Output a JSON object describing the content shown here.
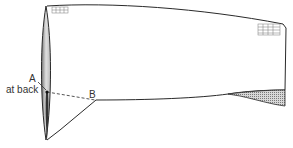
{
  "diagram": {
    "labels": {
      "point_a": "A",
      "point_a_note": "at back",
      "point_b": "B"
    },
    "colors": {
      "line": "#2a2a2a",
      "shade": "#9a9a9a",
      "background": "#ffffff"
    }
  }
}
